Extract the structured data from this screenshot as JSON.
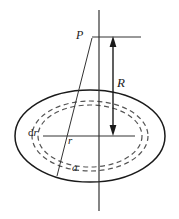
{
  "figure": {
    "background_color": "#ffffff",
    "stroke_color": "#1a1a1a",
    "dashed_color": "#555555",
    "thin_color": "#333333",
    "width": 179,
    "height": 219,
    "labels": {
      "point_p": "P",
      "distance_r_axial": "R",
      "radius_r": "r",
      "radius_a": "a",
      "thickness_dr_prefix": "d",
      "thickness_dr_var": "r"
    },
    "elements": {
      "vertical_axis": "vertical-symmetry-axis",
      "disc": "charged-disc-ellipse",
      "ring_outer": "annulus-outer-dashed-ellipse",
      "ring_inner": "annulus-inner-dashed-ellipse",
      "arrow_R": "double-headed-arrow-R",
      "horizontal_at_p": "horizontal-reference-line",
      "radius_line": "radius-line-r",
      "slant_line": "slant-line-a"
    }
  }
}
